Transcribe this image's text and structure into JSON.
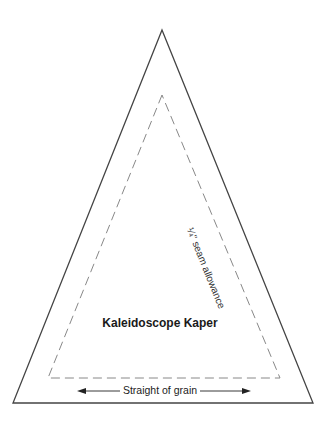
{
  "template": {
    "title": "Kaleidoscope Kaper",
    "seam_label": "¼\" seam allowance",
    "grain_label": "Straight of grain",
    "outer_triangle": {
      "apex": [
        162,
        30
      ],
      "bottom_left": [
        13,
        403
      ],
      "bottom_right": [
        313,
        403
      ],
      "color": "#444444"
    },
    "inner_dashed_triangle": {
      "apex": [
        162,
        95
      ],
      "bottom_left": [
        48,
        378
      ],
      "bottom_right": [
        280,
        378
      ],
      "color": "#888888"
    },
    "grain_arrow": {
      "x1": 78,
      "x2": 250,
      "y": 391
    }
  }
}
